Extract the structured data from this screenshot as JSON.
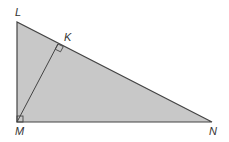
{
  "diagram": {
    "type": "right triangle with altitude",
    "colors": {
      "fill": "#c8c8c8",
      "stroke": "#444444",
      "label": "#333333"
    },
    "points": {
      "L": {
        "label": "L",
        "x": 17,
        "y": 22
      },
      "M": {
        "label": "M",
        "x": 17,
        "y": 122
      },
      "N": {
        "label": "N",
        "x": 212,
        "y": 122
      },
      "K": {
        "label": "K",
        "x": 58,
        "y": 44
      }
    },
    "right_angles": [
      "M",
      "K"
    ],
    "segments": [
      "LM",
      "MN",
      "LN",
      "MK"
    ]
  }
}
